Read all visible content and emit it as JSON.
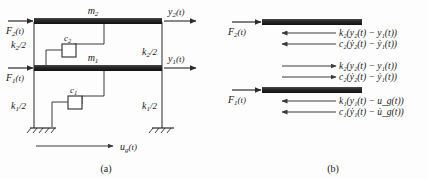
{
  "figure": {
    "panels": [
      {
        "id": "a",
        "caption": "(a)",
        "title": "two-dof-structural-model"
      },
      {
        "id": "b",
        "caption": "(b)",
        "title": "free-body-diagrams"
      }
    ]
  },
  "panel_a": {
    "masses": [
      {
        "name": "m2",
        "label": "m",
        "sub": "2"
      },
      {
        "name": "m1",
        "label": "m",
        "sub": "1"
      }
    ],
    "forces": [
      {
        "name": "F2",
        "label": "F",
        "sub": "2",
        "arg": "(t)"
      },
      {
        "name": "F1",
        "label": "F",
        "sub": "1",
        "arg": "(t)"
      }
    ],
    "displacements": [
      {
        "name": "y2",
        "label": "y",
        "sub": "2",
        "arg": "(t)"
      },
      {
        "name": "y1",
        "label": "y",
        "sub": "1",
        "arg": "(t)"
      }
    ],
    "springs": [
      {
        "name": "k2-left",
        "label": "k",
        "sub": "2",
        "suffix": "/2"
      },
      {
        "name": "k2-right",
        "label": "k",
        "sub": "2",
        "suffix": "/2"
      },
      {
        "name": "k1-left",
        "label": "k",
        "sub": "1",
        "suffix": "/2"
      },
      {
        "name": "k1-right",
        "label": "k",
        "sub": "1",
        "suffix": "/2"
      }
    ],
    "dampers": [
      {
        "name": "c2",
        "label": "c",
        "sub": "2"
      },
      {
        "name": "c1",
        "label": "c",
        "sub": "1"
      }
    ],
    "ground_motion": {
      "label": "u",
      "sub": "g",
      "arg": "(t)"
    }
  },
  "panel_b": {
    "body_top": {
      "applied_force": {
        "label": "F",
        "sub": "2",
        "arg": "(t)"
      },
      "reactions": [
        {
          "name": "spring-force-k2",
          "text": "k₂(y₂(t) − y₁(t))",
          "direction": "left"
        },
        {
          "name": "damper-force-c2",
          "text": "c₂(ẏ₂(t) − ẏ₁(t))",
          "direction": "left"
        }
      ]
    },
    "body_bottom": {
      "applied_force": {
        "label": "F",
        "sub": "1",
        "arg": "(t)"
      },
      "upper_reactions": [
        {
          "name": "spring-force-k2-react",
          "text": "k₂(y₂(t) − y₁(t))",
          "direction": "right"
        },
        {
          "name": "damper-force-c2-react",
          "text": "c₂(ẏ₂(t) − ẏ₁(t))",
          "direction": "right"
        }
      ],
      "lower_reactions": [
        {
          "name": "spring-force-k1",
          "text": "k₁(y₁(t) − u_g(t))",
          "direction": "left"
        },
        {
          "name": "damper-force-c1",
          "text": "c₁(ẏ₁(t) − u̇_g(t))",
          "direction": "left"
        }
      ]
    }
  },
  "colors": {
    "mass_bar": "#2b2b2b",
    "line": "#4a4a4a",
    "text": "#1a1a1a",
    "background": "#fdfdfd"
  }
}
